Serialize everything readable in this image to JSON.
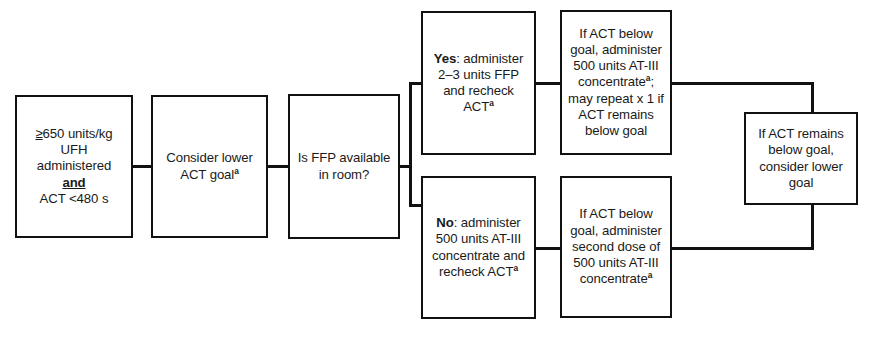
{
  "diagram": {
    "line_color": "#111111",
    "box_fill": "#ffffff",
    "text_color": "#1a1a1a",
    "footnote_marker": "a",
    "nodes": {
      "trigger": {
        "id": "trigger",
        "line1_prefix": "≥",
        "text": "≥650 units/kg\nUFH\nadministered\nand\nACT <480 s",
        "line1": "≥650 units/kg",
        "line2": "UFH",
        "line3": "administered",
        "line4": "and",
        "line5": "ACT <480 s"
      },
      "consider_lower_goal": {
        "id": "consider_lower_goal",
        "line1": "Consider lower",
        "line2": "ACT goal",
        "superscript": "a"
      },
      "ffp_question": {
        "id": "ffp_question",
        "line1": "Is FFP available",
        "line2": "in room?"
      },
      "yes_branch": {
        "id": "yes_branch",
        "label": "Yes",
        "line1_rest": ": administer",
        "line2": "2–3 units FFP",
        "line3": "and recheck",
        "line4": "ACT",
        "superscript": "a"
      },
      "no_branch": {
        "id": "no_branch",
        "label": "No",
        "line1_rest": ": administer",
        "line2": "500 units AT-III",
        "line3": "concentrate and",
        "line4": "recheck ACT",
        "superscript": "a"
      },
      "yes_followup": {
        "id": "yes_followup",
        "line1": "If ACT below",
        "line2": "goal, administer",
        "line3": "500 units AT-III",
        "line4": "concentrate",
        "superscript": "a",
        "line4_suffix": ";",
        "line5": "may repeat x 1 if",
        "line6": "ACT remains",
        "line7": "below goal"
      },
      "no_followup": {
        "id": "no_followup",
        "line1": "If ACT below",
        "line2": "goal, administer",
        "line3": "second dose of",
        "line4": "500 units AT-III",
        "line5": "concentrate",
        "superscript": "a"
      },
      "final": {
        "id": "final",
        "line1": "If ACT remains",
        "line2": "below goal,",
        "line3": "consider lower",
        "line4": "goal"
      }
    }
  }
}
